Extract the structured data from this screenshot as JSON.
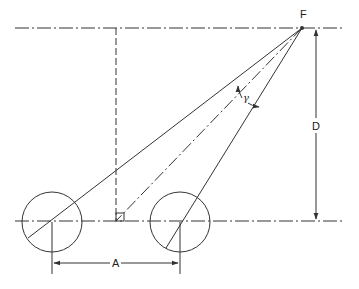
{
  "diagram": {
    "labels": {
      "focus": "F",
      "distance": "D",
      "spacing": "A",
      "angle": "γ"
    },
    "colors": {
      "stroke": "#333333",
      "background": "#ffffff"
    },
    "elements": {
      "top_centerline": {
        "x1": 15,
        "y1": 28,
        "x2": 342,
        "y2": 28,
        "style": "dash-dot"
      },
      "base_centerline": {
        "x1": 15,
        "y1": 221,
        "x2": 342,
        "y2": 221,
        "style": "dash-dot"
      },
      "vertical_projection": {
        "x1": 116,
        "y1": 28,
        "x2": 116,
        "y2": 221,
        "style": "dashed"
      },
      "left_circle": {
        "cx": 52,
        "cy": 222,
        "r": 30
      },
      "right_circle": {
        "cx": 180,
        "cy": 222,
        "r": 30
      },
      "focus_point": {
        "x": 302,
        "y": 28
      },
      "dimension_A": {
        "x1": 52,
        "x2": 180,
        "y": 263
      },
      "dimension_D": {
        "x": 316,
        "y1": 28,
        "y2": 221
      }
    }
  }
}
